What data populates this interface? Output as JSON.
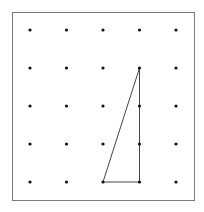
{
  "diagram": {
    "type": "geoboard-dot-grid",
    "grid": {
      "columns": 5,
      "rows": 5
    },
    "colors": {
      "border": "#7a7a7a",
      "dot": "#111111",
      "line": "#444444",
      "background": "#ffffff"
    },
    "polygon": {
      "name": "triangle",
      "vertices": [
        {
          "col": 4,
          "row": 2
        },
        {
          "col": 4,
          "row": 5
        },
        {
          "col": 3,
          "row": 5
        }
      ]
    }
  }
}
